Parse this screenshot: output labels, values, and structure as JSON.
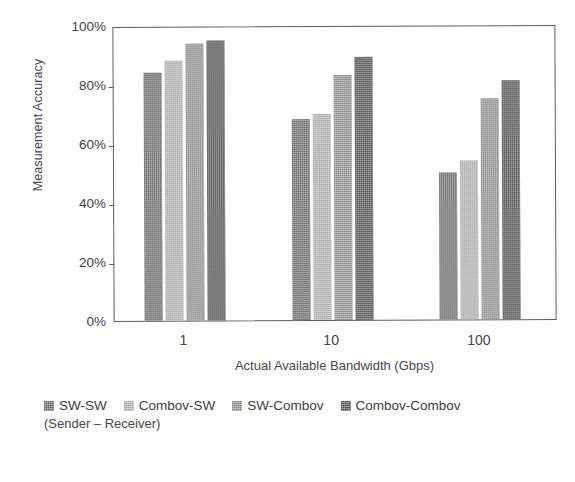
{
  "chart_data": {
    "type": "bar",
    "title": "",
    "subtitle": "",
    "xlabel": "Actual Available Bandwidth (Gbps)",
    "ylabel": "Measurement Accuracy",
    "categories": [
      "1",
      "10",
      "100"
    ],
    "ylim": [
      0,
      100
    ],
    "ytick_labels": [
      "0%",
      "20%",
      "40%",
      "60%",
      "80%",
      "100%"
    ],
    "ytick_values": [
      0,
      20,
      40,
      60,
      80,
      100
    ],
    "grid": false,
    "legend_position": "bottom",
    "legend_note": "(Sender – Receiver)",
    "value_unit": "%",
    "series": [
      {
        "name": "SW-SW",
        "color": "#6e6e6e",
        "values": [
          84,
          68,
          50
        ]
      },
      {
        "name": "Combov-SW",
        "color": "#b7b7b7",
        "values": [
          88,
          70,
          54
        ]
      },
      {
        "name": "SW-Combov",
        "color": "#949494",
        "values": [
          94,
          83,
          75
        ]
      },
      {
        "name": "Combov-Combov",
        "color": "#555555",
        "values": [
          95,
          89,
          81
        ]
      }
    ]
  },
  "axis": {
    "y_title": "Measurement Accuracy",
    "x_title": "Actual Available Bandwidth (Gbps)"
  },
  "colors": {
    "plot_border": "#5e5e5e",
    "plot_background": "#ffffff",
    "page_background": "#fdfdfc",
    "text": "#454545"
  }
}
